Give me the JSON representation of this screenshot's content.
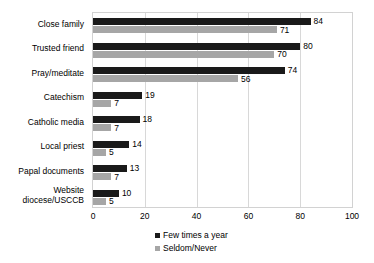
{
  "chart_data": {
    "type": "bar",
    "orientation": "horizontal",
    "title": "",
    "subtitle": "",
    "xlabel": "",
    "ylabel": "",
    "xlim": [
      0,
      100
    ],
    "xticks": [
      0,
      20,
      40,
      60,
      80,
      100
    ],
    "gridlines": [
      20,
      40,
      60,
      80
    ],
    "grid": true,
    "legend_position": "bottom",
    "categories": [
      "Close family",
      "Trusted friend",
      "Pray/meditate",
      "Catechism",
      "Catholic media",
      "Local priest",
      "Papal documents",
      "Website\ndiocese/USCCB"
    ],
    "series": [
      {
        "name": "Few times a year",
        "color": "#1a1a1a",
        "values": [
          84,
          80,
          74,
          19,
          18,
          14,
          13,
          10
        ]
      },
      {
        "name": "Seldom/Never",
        "color": "#a6a6a6",
        "values": [
          71,
          70,
          56,
          7,
          7,
          5,
          7,
          5
        ]
      }
    ],
    "data_labels": {
      "series_1": [
        "84",
        "80",
        "74",
        "19",
        "18",
        "14",
        "13",
        "10"
      ],
      "series_2": [
        "71",
        "70",
        "56",
        "7",
        "7",
        "5",
        "7",
        "5"
      ]
    },
    "xtick_labels": [
      "0",
      "20",
      "40",
      "60",
      "80",
      "100"
    ],
    "legend_entries": [
      "Few times a year",
      "Seldom/Never"
    ]
  }
}
